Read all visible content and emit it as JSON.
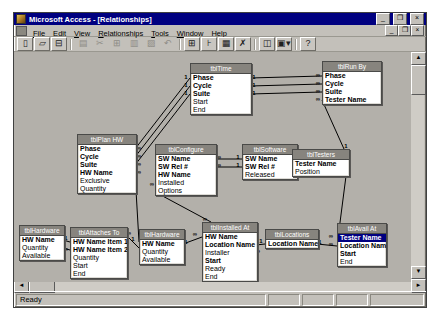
{
  "window": {
    "title": "Microsoft Access - [Relationships]",
    "controls": {
      "minimize": "_",
      "restore": "❐",
      "close": "×"
    },
    "mdi_controls": {
      "minimize": "_",
      "restore": "❐",
      "close": "×"
    }
  },
  "menu": {
    "items": [
      "File",
      "Edit",
      "View",
      "Relationships",
      "Tools",
      "Window",
      "Help"
    ]
  },
  "toolbar": {
    "buttons": [
      {
        "name": "new-database-button",
        "glyph": "▯",
        "disabled": false
      },
      {
        "name": "open-database-button",
        "glyph": "▱",
        "disabled": false
      },
      {
        "name": "save-button",
        "glyph": "⊟",
        "disabled": false
      },
      {
        "name": "sep"
      },
      {
        "name": "print-button",
        "glyph": "▤",
        "disabled": true
      },
      {
        "name": "cut-button",
        "glyph": "✂",
        "disabled": true
      },
      {
        "name": "copy-button",
        "glyph": "⊞",
        "disabled": true
      },
      {
        "name": "paste-button",
        "glyph": "▥",
        "disabled": true
      },
      {
        "name": "format-painter-button",
        "glyph": "▨",
        "disabled": true
      },
      {
        "name": "undo-button",
        "glyph": "↶",
        "disabled": true
      },
      {
        "name": "sep"
      },
      {
        "name": "show-table-button",
        "glyph": "⊞",
        "disabled": false
      },
      {
        "name": "show-direct-relationships-button",
        "glyph": "⊦",
        "disabled": false
      },
      {
        "name": "show-all-relationships-button",
        "glyph": "▦",
        "disabled": false
      },
      {
        "name": "clear-layout-button",
        "glyph": "✗",
        "disabled": false
      },
      {
        "name": "sep"
      },
      {
        "name": "database-window-button",
        "glyph": "◫",
        "disabled": false
      },
      {
        "name": "new-object-button",
        "glyph": "▣▾",
        "disabled": false
      },
      {
        "name": "sep"
      },
      {
        "name": "office-assistant-button",
        "glyph": "?",
        "disabled": false
      }
    ]
  },
  "scrollbars": {
    "up": "▲",
    "down": "▼",
    "left": "◄",
    "right": "►"
  },
  "statusbar": {
    "message": "Ready",
    "panels": [
      "",
      "",
      "",
      ""
    ]
  },
  "colors": {
    "titlebar": "#000080",
    "canvas": "#b3b0aa",
    "chrome": "#c3c0ba",
    "table_title": "#87847e",
    "selection": "#000080",
    "line": "#000000"
  },
  "tables": [
    {
      "title": "tblTime",
      "x": 176,
      "y": 11,
      "w": 60,
      "fields": [
        {
          "n": "Phase",
          "b": true
        },
        {
          "n": "Cycle",
          "b": true
        },
        {
          "n": "Suite",
          "b": true
        },
        {
          "n": "Start",
          "b": false
        },
        {
          "n": "End",
          "b": false
        }
      ]
    },
    {
      "title": "tblRun By",
      "x": 308,
      "y": 9,
      "w": 58,
      "fields": [
        {
          "n": "Phase",
          "b": true
        },
        {
          "n": "Cycle",
          "b": true
        },
        {
          "n": "Suite",
          "b": true
        },
        {
          "n": "Tester Name",
          "b": true
        }
      ]
    },
    {
      "title": "tblPlan HW",
      "x": 63,
      "y": 82,
      "w": 58,
      "fields": [
        {
          "n": "Phase",
          "b": true
        },
        {
          "n": "Cycle",
          "b": true
        },
        {
          "n": "Suite",
          "b": true
        },
        {
          "n": "HW Name",
          "b": true
        },
        {
          "n": "Exclusive",
          "b": false
        },
        {
          "n": "Quantity",
          "b": false
        }
      ]
    },
    {
      "title": "tblConfigure",
      "x": 141,
      "y": 92,
      "w": 60,
      "fields": [
        {
          "n": "SW Name",
          "b": true
        },
        {
          "n": "SW Rel #",
          "b": true
        },
        {
          "n": "HW Name",
          "b": true
        },
        {
          "n": "Installed",
          "b": false
        },
        {
          "n": "Options",
          "b": false
        }
      ]
    },
    {
      "title": "tblSoftware",
      "x": 228,
      "y": 92,
      "w": 54,
      "fields": [
        {
          "n": "SW Name",
          "b": true
        },
        {
          "n": "SW Rel #",
          "b": true
        },
        {
          "n": "Released",
          "b": false
        }
      ]
    },
    {
      "title": "tblTesters",
      "x": 278,
      "y": 97,
      "w": 56,
      "fields": [
        {
          "n": "Tester Name",
          "b": true
        },
        {
          "n": "Position",
          "b": false
        }
      ]
    },
    {
      "title": "tblHardware",
      "x": 5,
      "y": 173,
      "w": 44,
      "fields": [
        {
          "n": "HW Name",
          "b": true
        },
        {
          "n": "Quantity",
          "b": false
        },
        {
          "n": "Available",
          "b": false
        }
      ]
    },
    {
      "title": "tblAttaches To",
      "x": 56,
      "y": 175,
      "w": 56,
      "fields": [
        {
          "n": "HW Name Item 1",
          "b": true
        },
        {
          "n": "HW Name Item 2",
          "b": true
        },
        {
          "n": "Quantity",
          "b": false
        },
        {
          "n": "Start",
          "b": false
        },
        {
          "n": "End",
          "b": false
        }
      ]
    },
    {
      "title": "tblHardware",
      "x": 125,
      "y": 177,
      "w": 44,
      "fields": [
        {
          "n": "HW Name",
          "b": true
        },
        {
          "n": "Quantity",
          "b": false
        },
        {
          "n": "Available",
          "b": false
        }
      ]
    },
    {
      "title": "tblInstalled At",
      "x": 188,
      "y": 170,
      "w": 54,
      "fields": [
        {
          "n": "HW Name",
          "b": true
        },
        {
          "n": "Location Name",
          "b": true
        },
        {
          "n": "Installer",
          "b": false
        },
        {
          "n": "Start",
          "b": true
        },
        {
          "n": "Ready",
          "b": false
        },
        {
          "n": "End",
          "b": false
        }
      ]
    },
    {
      "title": "tblLocations",
      "x": 251,
      "y": 177,
      "w": 52,
      "fields": [
        {
          "n": "Location Name",
          "b": true
        }
      ]
    },
    {
      "title": "tblAvail At",
      "x": 323,
      "y": 171,
      "w": 48,
      "fields": [
        {
          "n": "Tester Name",
          "b": true,
          "sel": true
        },
        {
          "n": "Location Name",
          "b": true
        },
        {
          "n": "Start",
          "b": true
        },
        {
          "n": "End",
          "b": false
        }
      ]
    }
  ],
  "relationships": [
    {
      "x1": 176,
      "y1": 26,
      "x2": 121,
      "y2": 97,
      "a": "1",
      "ax": 172,
      "ay": 24,
      "b": "∞",
      "bx": 125,
      "by": 95
    },
    {
      "x1": 176,
      "y1": 34,
      "x2": 121,
      "y2": 105,
      "a": "1",
      "ax": 172,
      "ay": 32,
      "b": "∞",
      "bx": 125,
      "by": 103
    },
    {
      "x1": 176,
      "y1": 42,
      "x2": 121,
      "y2": 113,
      "a": "1",
      "ax": 172,
      "ay": 40,
      "b": "∞",
      "bx": 125,
      "by": 111
    },
    {
      "x1": 236,
      "y1": 26,
      "x2": 308,
      "y2": 24,
      "a": "1",
      "ax": 240,
      "ay": 24,
      "b": "∞",
      "bx": 304,
      "by": 22
    },
    {
      "x1": 236,
      "y1": 34,
      "x2": 308,
      "y2": 32,
      "a": "1",
      "ax": 240,
      "ay": 32,
      "b": "∞",
      "bx": 304,
      "by": 30
    },
    {
      "x1": 236,
      "y1": 42,
      "x2": 308,
      "y2": 40,
      "a": "1",
      "ax": 240,
      "ay": 40,
      "b": "∞",
      "bx": 304,
      "by": 38
    },
    {
      "x1": 308,
      "y1": 48,
      "x2": 330,
      "y2": 97,
      "a": "∞",
      "ax": 304,
      "ay": 46,
      "b": "1",
      "bx": 332,
      "by": 93
    },
    {
      "x1": 201,
      "y1": 107,
      "x2": 228,
      "y2": 107,
      "a": "∞",
      "ax": 205,
      "ay": 104,
      "b": "1",
      "bx": 224,
      "by": 104
    },
    {
      "x1": 201,
      "y1": 115,
      "x2": 228,
      "y2": 115,
      "a": "∞",
      "ax": 205,
      "ay": 112,
      "b": "1",
      "bx": 224,
      "by": 112
    },
    {
      "x1": 121,
      "y1": 121,
      "x2": 125,
      "y2": 190,
      "a": "∞",
      "ax": 125,
      "ay": 119,
      "b": "1",
      "bx": 119,
      "by": 186
    },
    {
      "x1": 143,
      "y1": 141,
      "x2": 197,
      "y2": 170,
      "a": "∞",
      "ax": 138,
      "ay": 131,
      "b": "∞",
      "bx": 191,
      "by": 166
    },
    {
      "x1": 49,
      "y1": 188,
      "x2": 56,
      "y2": 190,
      "a": "1",
      "ax": 52,
      "ay": 185,
      "b": "",
      "bx": 0,
      "by": 0
    },
    {
      "x1": 49,
      "y1": 196,
      "x2": 56,
      "y2": 198,
      "a": "∞",
      "ax": 52,
      "ay": 196,
      "b": "",
      "bx": 0,
      "by": 0
    },
    {
      "x1": 112,
      "y1": 183,
      "x2": 125,
      "y2": 196,
      "a": "∞",
      "ax": 115,
      "ay": 180,
      "b": "",
      "bx": 0,
      "by": 0
    },
    {
      "x1": 169,
      "y1": 192,
      "x2": 188,
      "y2": 185,
      "a": "1",
      "ax": 172,
      "ay": 189,
      "b": "∞",
      "bx": 181,
      "by": 181
    },
    {
      "x1": 242,
      "y1": 193,
      "x2": 251,
      "y2": 192,
      "a": "∞",
      "ax": 244,
      "ay": 198,
      "b": "1",
      "bx": 247,
      "by": 188
    },
    {
      "x1": 303,
      "y1": 192,
      "x2": 323,
      "y2": 194,
      "a": "1",
      "ax": 306,
      "ay": 189,
      "b": "∞",
      "bx": 317,
      "by": 191
    },
    {
      "x1": 332,
      "y1": 124,
      "x2": 324,
      "y2": 186,
      "a": "",
      "ax": 0,
      "ay": 0,
      "b": "∞",
      "bx": 317,
      "by": 183
    }
  ]
}
